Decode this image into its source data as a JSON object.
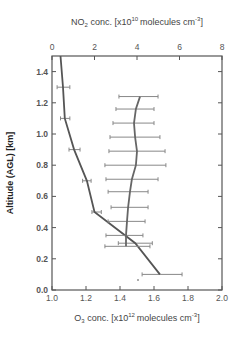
{
  "chart_data": {
    "type": "line",
    "title": "",
    "ylabel": "Altitude (AGL) [km]",
    "ylim": [
      0.0,
      1.5
    ],
    "yticks": [
      "0.0",
      "0.2",
      "0.4",
      "0.6",
      "0.8",
      "1.0",
      "1.2",
      "1.4"
    ],
    "x_bottom": {
      "label_prefix": "O",
      "label_sub": "3",
      "label_main": " conc. [x10",
      "label_exp": "12",
      "label_unit": "molecules cm",
      "label_unit_exp": "-3",
      "label_close": "]",
      "xlim": [
        1.0,
        2.0
      ],
      "ticks": [
        "1.0",
        "1.2",
        "1.4",
        "1.6",
        "1.8",
        "2.0"
      ]
    },
    "x_top": {
      "label_prefix": "NO",
      "label_sub": "2",
      "label_main": " conc. [x10",
      "label_exp": "10",
      "label_unit": "molecules cm",
      "label_unit_exp": "-3",
      "label_close": "]",
      "xlim": [
        0,
        8
      ],
      "ticks": [
        "0",
        "2",
        "4",
        "6",
        "8"
      ]
    },
    "grid": false,
    "series": [
      {
        "name": "O3",
        "axis": "bottom",
        "color": "#555555",
        "points": [
          {
            "alt": 1.5,
            "value": 1.05,
            "err_lo": null,
            "err_hi": null
          },
          {
            "alt": 1.3,
            "value": 1.065,
            "err_lo": 1.03,
            "err_hi": 1.105
          },
          {
            "alt": 1.1,
            "value": 1.075,
            "err_lo": 1.05,
            "err_hi": 1.105
          },
          {
            "alt": 0.9,
            "value": 1.13,
            "err_lo": 1.1,
            "err_hi": 1.165
          },
          {
            "alt": 0.7,
            "value": 1.205,
            "err_lo": 1.18,
            "err_hi": 1.23
          },
          {
            "alt": 0.5,
            "value": 1.25,
            "err_lo": 1.235,
            "err_hi": 1.29
          },
          {
            "alt": 0.3,
            "value": 1.49,
            "err_lo": 1.39,
            "err_hi": 1.59
          },
          {
            "alt": 0.1,
            "value": 1.635,
            "err_lo": 1.53,
            "err_hi": 1.765
          }
        ]
      },
      {
        "name": "NO2",
        "axis": "top",
        "color": "#666666",
        "points": [
          {
            "alt": 1.24,
            "value": 4.14,
            "err_lo": 3.15,
            "err_hi": 4.99
          },
          {
            "alt": 1.16,
            "value": 3.95,
            "err_lo": 3.01,
            "err_hi": 4.8
          },
          {
            "alt": 1.07,
            "value": 3.86,
            "err_lo": 2.87,
            "err_hi": 4.8
          },
          {
            "alt": 0.98,
            "value": 3.91,
            "err_lo": 2.73,
            "err_hi": 5.08
          },
          {
            "alt": 0.89,
            "value": 4.0,
            "err_lo": 2.68,
            "err_hi": 5.32
          },
          {
            "alt": 0.8,
            "value": 3.95,
            "err_lo": 2.49,
            "err_hi": 5.36
          },
          {
            "alt": 0.71,
            "value": 3.76,
            "err_lo": 2.54,
            "err_hi": 4.99
          },
          {
            "alt": 0.63,
            "value": 3.67,
            "err_lo": 2.64,
            "err_hi": 4.52
          },
          {
            "alt": 0.53,
            "value": 3.58,
            "err_lo": 2.78,
            "err_hi": 4.52
          },
          {
            "alt": 0.44,
            "value": 3.53,
            "err_lo": 2.64,
            "err_hi": 4.38
          },
          {
            "alt": 0.35,
            "value": 3.48,
            "err_lo": 2.54,
            "err_hi": 4.28
          },
          {
            "alt": 0.28,
            "value": 3.48,
            "err_lo": 2.49,
            "err_hi": 4.61
          }
        ]
      }
    ],
    "legend": null
  }
}
